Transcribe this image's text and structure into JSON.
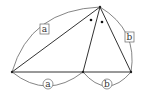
{
  "diagram": {
    "line_color": "#333333",
    "arc_color": "#555555",
    "vertices": {
      "left": [
        12,
        72
      ],
      "apex": [
        100,
        7
      ],
      "foot": [
        83,
        72
      ],
      "right": [
        131,
        72
      ]
    },
    "labels": {
      "side_left": "a",
      "side_right": "b",
      "base_left": "a",
      "base_right": "b"
    },
    "angle_marks": "equal-angle dots"
  }
}
